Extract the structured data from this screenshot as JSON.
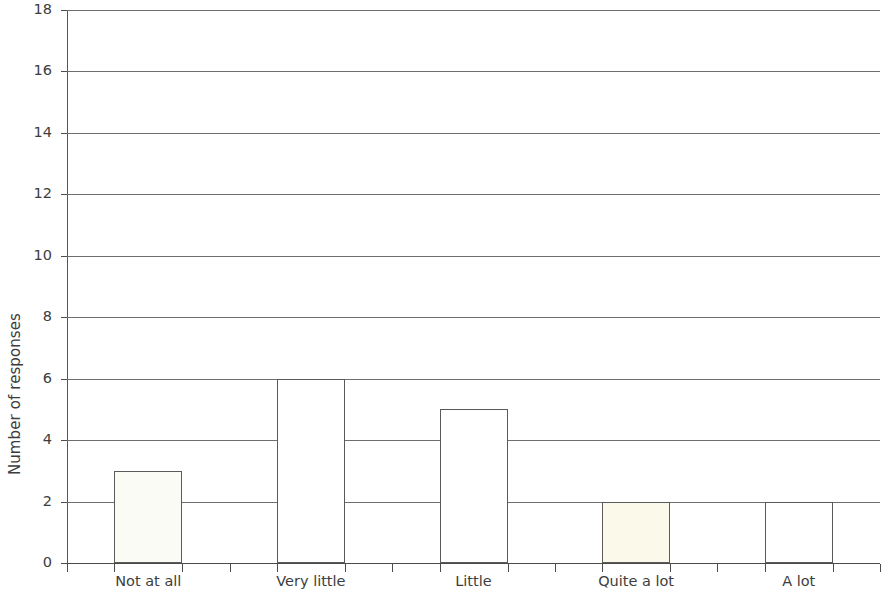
{
  "chart_data": {
    "type": "bar",
    "title": "",
    "subtitle": "",
    "xlabel": "",
    "ylabel": "Number of responses",
    "categories": [
      "Not at all",
      "Very little",
      "Little",
      "Quite a lot",
      "A lot"
    ],
    "values": [
      3,
      6,
      5,
      2,
      2
    ],
    "ylim": [
      0,
      18
    ],
    "ytick_step": 2,
    "ytick_labels": [
      "0",
      "2",
      "4",
      "6",
      "8",
      "10",
      "12",
      "14",
      "16",
      "18"
    ],
    "grid": true,
    "grid_axis": "y",
    "legend": false,
    "legend_position": "none",
    "bar_fills": [
      "#fbfbf6",
      "#ffffff",
      "#ffffff",
      "#fbfaea",
      "#ffffff"
    ],
    "bar_border_color": "#5a5a5a",
    "gridline_color": "#6e6e6e",
    "axis_color": "#4a4a4a",
    "background_color": "#ffffff",
    "text_color": "#3d3d3d"
  }
}
